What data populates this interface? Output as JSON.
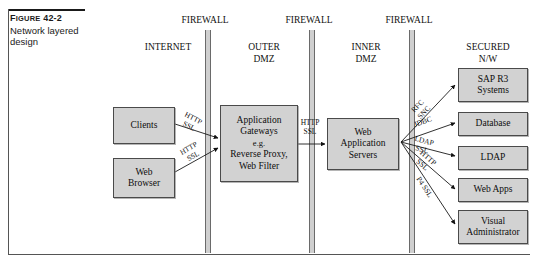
{
  "figure": {
    "number_prefix": "F",
    "number_rest": "IGURE",
    "number": "42-2",
    "title": "Network layered design"
  },
  "zones": [
    {
      "name": "internet",
      "label": "INTERNET",
      "x": 132,
      "width": 72
    },
    {
      "name": "outer-dmz",
      "label": "OUTER\nDMZ",
      "x": 228,
      "width": 72
    },
    {
      "name": "inner-dmz",
      "label": "INNER\nDMZ",
      "x": 330,
      "width": 72
    },
    {
      "name": "secured-nw",
      "label": "SECURED\nN/W",
      "x": 448,
      "width": 80
    }
  ],
  "firewalls": [
    {
      "name": "firewall-1",
      "label": "FIREWALL",
      "x": 205,
      "label_x": 168
    },
    {
      "name": "firewall-2",
      "label": "FIREWALL",
      "x": 309,
      "label_x": 272
    },
    {
      "name": "firewall-3",
      "label": "FIREWALL",
      "x": 409,
      "label_x": 372
    }
  ],
  "nodes": [
    {
      "name": "clients",
      "label": "Clients",
      "x": 113,
      "y": 107,
      "w": 62,
      "h": 37
    },
    {
      "name": "web-browser",
      "label": "Web\nBrowser",
      "x": 113,
      "y": 158,
      "w": 62,
      "h": 40
    },
    {
      "name": "application-gateways",
      "label": "Application\nGateways\n|e.g.\nReverse Proxy,\nWeb Filter",
      "x": 220,
      "y": 105,
      "w": 78,
      "h": 77
    },
    {
      "name": "web-application-servers",
      "label": "Web\nApplication\nServers",
      "x": 327,
      "y": 118,
      "w": 72,
      "h": 52
    },
    {
      "name": "sap-r3-systems",
      "label": "SAP R3\nSystems",
      "x": 458,
      "y": 68,
      "w": 70,
      "h": 34
    },
    {
      "name": "database",
      "label": "Database",
      "x": 458,
      "y": 112,
      "w": 70,
      "h": 24
    },
    {
      "name": "ldap",
      "label": "LDAP",
      "x": 458,
      "y": 146,
      "w": 70,
      "h": 24
    },
    {
      "name": "web-apps",
      "label": "Web Apps",
      "x": 458,
      "y": 178,
      "w": 70,
      "h": 24
    },
    {
      "name": "visual-administrator",
      "label": "Visual\nAdministrator",
      "x": 458,
      "y": 210,
      "w": 70,
      "h": 34
    }
  ],
  "connections": [
    {
      "name": "clients-to-gateways",
      "label": "HTTP\nSSL",
      "x1": 175,
      "y1": 124,
      "x2": 218,
      "y2": 138,
      "lx": 191,
      "ly": 123,
      "rot": 28
    },
    {
      "name": "browser-to-gateways",
      "label": "HTTP\nSSL",
      "x1": 175,
      "y1": 172,
      "x2": 218,
      "y2": 148,
      "lx": 191,
      "ly": 153,
      "rot": -30
    },
    {
      "name": "gateways-to-webappservers",
      "label": "HTTP\nSSL",
      "x1": 298,
      "y1": 144,
      "x2": 325,
      "y2": 144,
      "lx": 310,
      "ly": 128,
      "rot": 0
    },
    {
      "name": "webapp-to-sap-r3",
      "label": "RFC\nSNC",
      "x1": 401,
      "y1": 142,
      "x2": 455,
      "y2": 85,
      "lx": 421,
      "ly": 110,
      "rot": -46
    },
    {
      "name": "webapp-to-database",
      "label": "JDBC",
      "x1": 401,
      "y1": 142,
      "x2": 455,
      "y2": 123,
      "lx": 423,
      "ly": 127,
      "rot": -19
    },
    {
      "name": "webapp-to-ldap",
      "label": "LDAP\nSSL",
      "x1": 401,
      "y1": 142,
      "x2": 455,
      "y2": 156,
      "lx": 423,
      "ly": 146,
      "rot": 15
    },
    {
      "name": "webapp-to-web-apps",
      "label": "HTTP\nSSL",
      "x1": 401,
      "y1": 142,
      "x2": 455,
      "y2": 189,
      "lx": 425,
      "ly": 162,
      "rot": 41
    },
    {
      "name": "webapp-to-visual-admin",
      "label": "P4 SSL",
      "x1": 401,
      "y1": 142,
      "x2": 455,
      "y2": 224,
      "lx": 424,
      "ly": 192,
      "rot": 57
    }
  ],
  "colors": {
    "box_fill": "#d2d2d2",
    "box_border": "#4a4a4a",
    "firewall_fill": "#cfcfcf",
    "line": "#1a1a1a",
    "text": "#0d0d0d"
  }
}
